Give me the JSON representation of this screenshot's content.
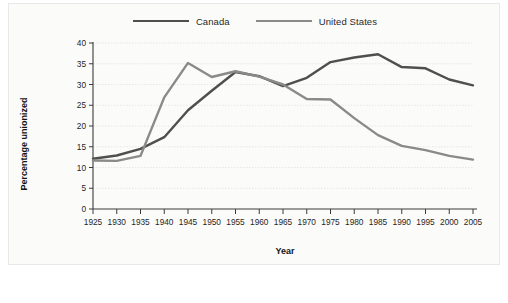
{
  "chart_data": {
    "type": "line",
    "title": "",
    "xlabel": "Year",
    "ylabel": "Percentage unionized",
    "x": [
      1925,
      1930,
      1935,
      1940,
      1945,
      1950,
      1955,
      1960,
      1965,
      1970,
      1975,
      1980,
      1985,
      1990,
      1995,
      2000,
      2005
    ],
    "xlim": [
      1925,
      2005
    ],
    "ylim": [
      0,
      40
    ],
    "yticks": [
      0,
      5,
      10,
      15,
      20,
      25,
      30,
      35,
      40
    ],
    "xticks": [
      "1925",
      "1930",
      "1935",
      "1940",
      "1945",
      "1950",
      "1955",
      "1960",
      "1965",
      "1970",
      "1975",
      "1980",
      "1985",
      "1990",
      "1995",
      "2000",
      "2005"
    ],
    "ytick_labels": [
      "0",
      "5",
      "10",
      "15",
      "20",
      "25",
      "30",
      "35",
      "40"
    ],
    "grid": true,
    "legend_position": "top-center",
    "series": [
      {
        "name": "Canada",
        "color": "#4f4f4f",
        "width": 2.4,
        "values": [
          12.1,
          12.9,
          14.5,
          17.3,
          23.8,
          28.5,
          33.0,
          32.0,
          29.6,
          31.6,
          35.4,
          36.5,
          37.3,
          34.2,
          33.9,
          31.2,
          29.8
        ]
      },
      {
        "name": "United States",
        "color": "#8a8a8a",
        "width": 2.4,
        "values": [
          11.7,
          11.6,
          12.8,
          26.9,
          35.2,
          31.8,
          33.2,
          31.9,
          30.0,
          26.5,
          26.4,
          21.9,
          17.8,
          15.2,
          14.2,
          12.8,
          11.9
        ]
      }
    ],
    "annotations": []
  },
  "legend": {
    "entries": [
      {
        "label": "Canada"
      },
      {
        "label": "United States"
      }
    ]
  }
}
